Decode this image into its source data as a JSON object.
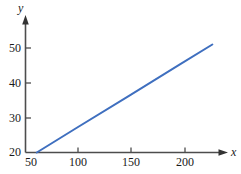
{
  "chart_data": {
    "type": "line",
    "title": "",
    "subtitle": "",
    "xlabel": "x",
    "ylabel": "y",
    "xlim": [
      50,
      240
    ],
    "ylim": [
      20,
      58
    ],
    "xticks": [
      50,
      100,
      150,
      200
    ],
    "xtick_labels": [
      "50",
      "100",
      "150",
      "200"
    ],
    "yticks": [
      20,
      30,
      40,
      50
    ],
    "ytick_labels": [
      "20",
      "30",
      "40",
      "50"
    ],
    "grid": false,
    "legend": null,
    "annotations": [],
    "series": [
      {
        "name": "line",
        "color": "#3f6fbf",
        "x": [
          61,
          100,
          150,
          200,
          232
        ],
        "y": [
          20,
          27.1,
          36.1,
          45.2,
          51.0
        ]
      }
    ],
    "line_equation": {
      "slope": 0.181,
      "intercept": 8.96,
      "x_intercept_at_y20": 61,
      "endpoint": [
        232,
        51
      ]
    },
    "axis_style": {
      "x_axis_arrow": true,
      "y_axis_arrow": true,
      "axis_color": "#4d4d4d",
      "tick_direction": "out"
    }
  }
}
